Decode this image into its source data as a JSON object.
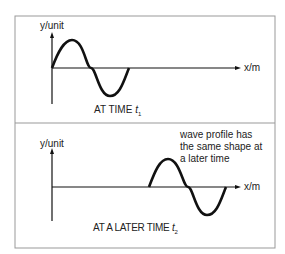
{
  "panel_top": {
    "y_axis_label": "y/unit",
    "x_axis_label": "x/m",
    "caption": "AT TIME",
    "caption_time": "t",
    "caption_sub": "1"
  },
  "panel_bottom": {
    "y_axis_label": "y/unit",
    "x_axis_label": "x/m",
    "caption": "AT A LATER TIME",
    "caption_time": "t",
    "caption_sub": "2",
    "annotation": [
      "wave profile has",
      "the same shape at",
      "a later time"
    ]
  },
  "colors": {
    "line": "#111111",
    "border": "#999999"
  }
}
